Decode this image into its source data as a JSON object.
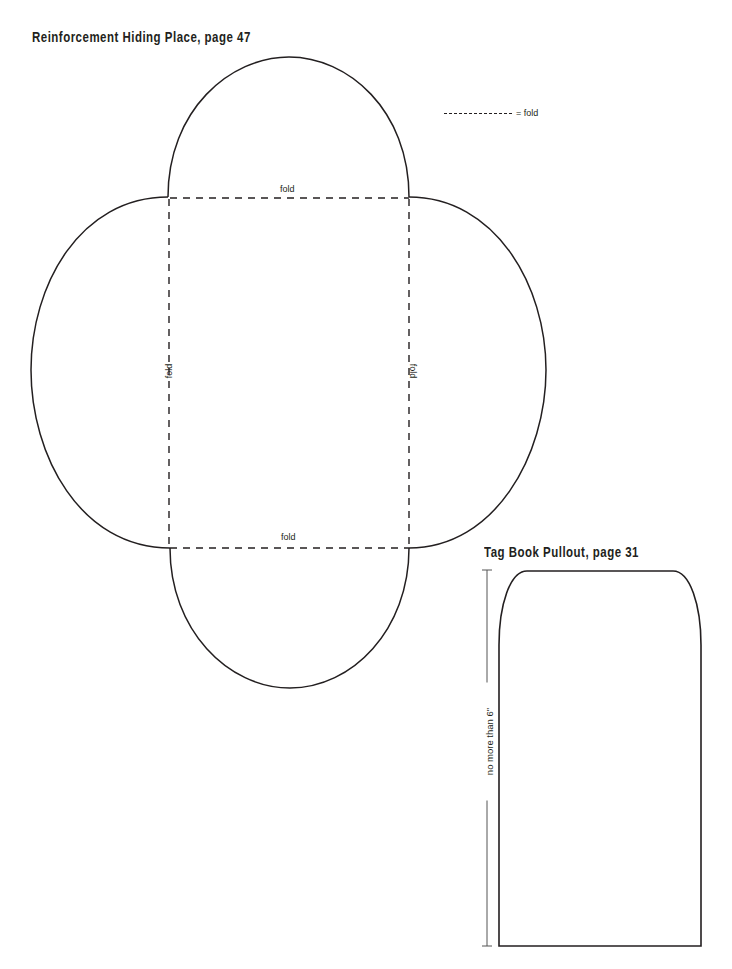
{
  "templates": {
    "reinforcement": {
      "title": "Reinforcement Hiding Place, page 47",
      "legend": {
        "symbol": "dashed-line",
        "label": "= fold"
      },
      "fold_labels": {
        "top": "fold",
        "bottom": "fold",
        "left": "fold",
        "right": "fold"
      },
      "shape": {
        "center_rect": {
          "x": 168,
          "y": 197,
          "width": 241,
          "height": 351
        },
        "lobes": [
          "top",
          "bottom",
          "left",
          "right"
        ]
      }
    },
    "tag_book": {
      "title": "Tag Book Pullout, page 31",
      "dimension_label": "no more than 6\"",
      "shape": {
        "x": 498,
        "y": 571,
        "width": 203,
        "height": 375,
        "rounded_top_corners": true
      }
    }
  },
  "colors": {
    "ink": "#231f20",
    "background": "#ffffff"
  }
}
